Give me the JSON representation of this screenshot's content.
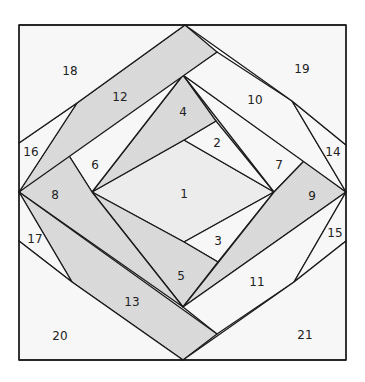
{
  "diagram": {
    "colors": {
      "background": "#ffffff",
      "light": "#f7f7f7",
      "shaded": "#dedede",
      "lightshade": "#ececec",
      "stroke": "#1a1a1a"
    },
    "pieces": [
      {
        "id": "1",
        "label": "1",
        "x": 184,
        "y": 194,
        "shade": "lightshade",
        "points": "184,140 274,192 184,242 92,192"
      },
      {
        "id": "2",
        "label": "2",
        "x": 217,
        "y": 143,
        "shade": "light",
        "points": "184,140 216,121 274,192"
      },
      {
        "id": "3",
        "label": "3",
        "x": 218,
        "y": 241,
        "shade": "light",
        "points": "184,242 274,192 218,262"
      },
      {
        "id": "4",
        "label": "4",
        "x": 183,
        "y": 112,
        "shade": "shaded",
        "points": "183,75 216,121 184,140 92,192"
      },
      {
        "id": "5",
        "label": "5",
        "x": 181,
        "y": 276,
        "shade": "shaded",
        "points": "92,192 184,242 218,262 183,307"
      },
      {
        "id": "6",
        "label": "6",
        "x": 95,
        "y": 165,
        "shade": "light",
        "points": "66,151 183,75 92,192"
      },
      {
        "id": "7",
        "label": "7",
        "x": 279,
        "y": 165,
        "shade": "light",
        "points": "183,75 304,161 274,192"
      },
      {
        "id": "8",
        "label": "8",
        "x": 55,
        "y": 195,
        "shade": "shaded",
        "points": "19,192 66,151 92,192 183,307"
      },
      {
        "id": "9",
        "label": "9",
        "x": 312,
        "y": 196,
        "shade": "shaded",
        "points": "274,192 304,161 346,192 183,307"
      },
      {
        "id": "10",
        "label": "10",
        "x": 255,
        "y": 100,
        "shade": "light",
        "points": "217,52 292,101 346,192 183,75"
      },
      {
        "id": "11",
        "label": "11",
        "x": 257,
        "y": 282,
        "shade": "light",
        "points": "183,307 346,192 294,282 217,334"
      },
      {
        "id": "12",
        "label": "12",
        "x": 120,
        "y": 97,
        "shade": "shaded",
        "points": "185,25 217,52 19,192 77,103"
      },
      {
        "id": "13",
        "label": "13",
        "x": 132,
        "y": 302,
        "shade": "shaded",
        "points": "19,192 217,334 183,360 72,282"
      },
      {
        "id": "14",
        "label": "14",
        "x": 333,
        "y": 152,
        "shade": "light",
        "points": "292,101 346,145 346,192"
      },
      {
        "id": "15",
        "label": "15",
        "x": 335,
        "y": 233,
        "shade": "light",
        "points": "346,192 346,241 294,282"
      },
      {
        "id": "16",
        "label": "16",
        "x": 31,
        "y": 152,
        "shade": "light",
        "points": "19,143 77,103 19,192"
      },
      {
        "id": "17",
        "label": "17",
        "x": 35,
        "y": 239,
        "shade": "light",
        "points": "19,192 72,282 19,241"
      },
      {
        "id": "18",
        "label": "18",
        "x": 70,
        "y": 71,
        "shade": "light",
        "points": "19,25 185,25 77,103 19,143"
      },
      {
        "id": "19",
        "label": "19",
        "x": 302,
        "y": 69,
        "shade": "light",
        "points": "185,25 346,25 346,145 292,101"
      },
      {
        "id": "20",
        "label": "20",
        "x": 60,
        "y": 336,
        "shade": "light",
        "points": "19,241 72,282 183,360 19,360"
      },
      {
        "id": "21",
        "label": "21",
        "x": 305,
        "y": 335,
        "shade": "light",
        "points": "346,241 346,360 183,360 294,282"
      }
    ],
    "frame": {
      "x": 19,
      "y": 25,
      "width": 327,
      "height": 335
    }
  }
}
